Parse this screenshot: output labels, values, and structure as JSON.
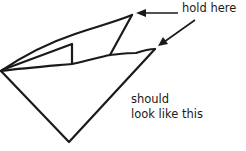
{
  "diagram": {
    "type": "folding-instruction-sketch",
    "stroke_color": "#1a1a1a",
    "background": "#ffffff",
    "labels": {
      "hold_here": "hold here",
      "should_line1": "should",
      "should_line2": "look like this"
    },
    "arrows": [
      {
        "from": "hold-here-label",
        "to": "top-peak"
      },
      {
        "from": "hold-here-label",
        "to": "right-tip"
      }
    ]
  }
}
